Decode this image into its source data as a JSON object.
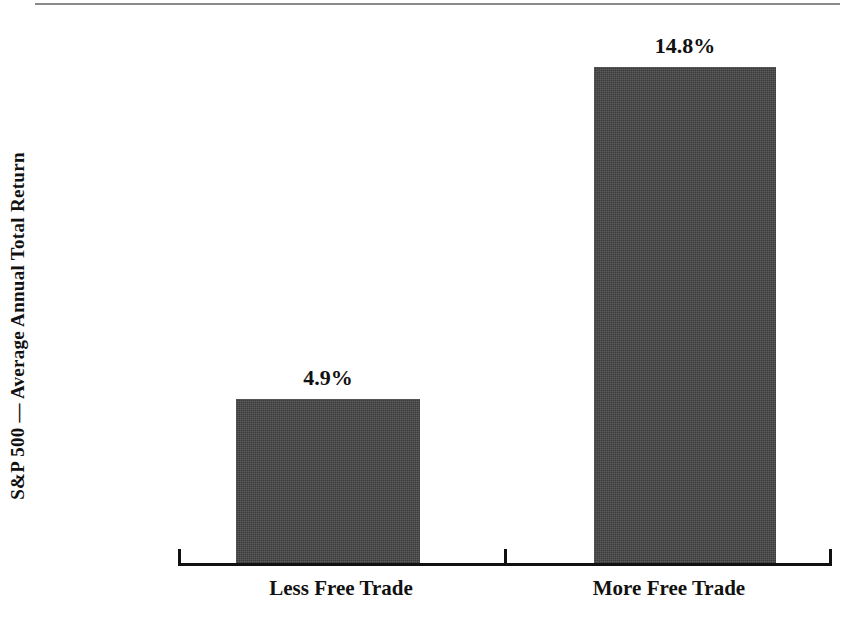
{
  "chart_data": {
    "type": "bar",
    "title": "",
    "subtitle": "",
    "xlabel": "",
    "ylabel": "S&P 500 — Average Annual Total Return",
    "categories": [
      "Less Free Trade",
      "More Free Trade"
    ],
    "values": [
      4.9,
      14.8
    ],
    "value_labels": [
      "4.9%",
      "14.8%"
    ],
    "units": "percent",
    "ylim": [
      0,
      18.8
    ],
    "grid": false,
    "legend": null,
    "legend_position": "none",
    "annotations": [],
    "bar_color": "#3b3b3b",
    "axis_color": "#111111",
    "background_color": "#ffffff",
    "rule_color": "#8a8a8a"
  },
  "figure": {
    "top_rule_present": true,
    "y_axis": {
      "title": "S&P 500 — Average Annual Total Return",
      "tick_labels": []
    },
    "x_axis": {
      "tick_labels": [
        "Less Free Trade",
        "More Free Trade"
      ],
      "tick_marks": [
        "end-left",
        "mid",
        "end-right"
      ]
    },
    "bars": [
      {
        "category": "Less Free Trade",
        "value": 4.9,
        "label": "4.9%"
      },
      {
        "category": "More Free Trade",
        "value": 14.8,
        "label": "14.8%"
      }
    ]
  }
}
